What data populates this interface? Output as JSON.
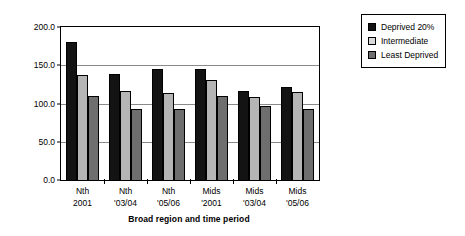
{
  "chart_data": {
    "type": "bar",
    "title": "",
    "xlabel": "Broad region and time period",
    "ylabel": "Index score",
    "ylim": [
      0,
      200
    ],
    "yticks": [
      0,
      50,
      100,
      150,
      200
    ],
    "ytick_labels": [
      "0.0",
      "50.0",
      "100.0",
      "150.0",
      "200.0"
    ],
    "grid": true,
    "legend_position": "right",
    "categories": [
      "Nth 2001",
      "Nth '03/04",
      "Nth '05/06",
      "Mids '2001",
      "Mids '03/04",
      "Mids '05/06"
    ],
    "category_lines": [
      [
        "Nth",
        "2001"
      ],
      [
        "Nth",
        "'03/04"
      ],
      [
        "Nth",
        "'05/06"
      ],
      [
        "Mids",
        "'2001"
      ],
      [
        "Mids",
        "'03/04"
      ],
      [
        "Mids",
        "'05/06"
      ]
    ],
    "series": [
      {
        "name": "Deprived 20%",
        "color": "#131313",
        "values": [
          181,
          139,
          145,
          145,
          117,
          122
        ]
      },
      {
        "name": "Intermediate",
        "color": "#d9d9d9",
        "values": [
          137,
          116,
          114,
          131,
          109,
          115
        ]
      },
      {
        "name": "Least Deprived",
        "color": "#6e6e6e",
        "values": [
          110,
          93,
          93,
          110,
          97,
          93
        ]
      }
    ]
  },
  "legend": {
    "items": [
      {
        "label": "Deprived 20%"
      },
      {
        "label": "Intermediate"
      },
      {
        "label": "Least Deprived"
      }
    ]
  }
}
